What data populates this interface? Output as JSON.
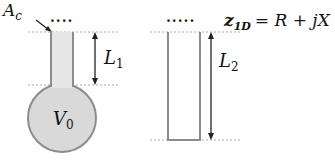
{
  "diagram": {
    "left_figure": {
      "name": "helmholtz-resonator",
      "labels": {
        "area_main": "A",
        "area_sub": "c",
        "length_main": "L",
        "length_sub": "1",
        "volume_main": "V",
        "volume_sub": "0"
      },
      "dots": "....",
      "colors": {
        "fill": "#d9d9d9",
        "stroke": "#8c8c8c"
      }
    },
    "right_figure": {
      "name": "closed-tube",
      "labels": {
        "length_main": "L",
        "length_sub": "2"
      },
      "dots": ".....",
      "colors": {
        "fill": "#ffffff",
        "stroke": "#8c8c8c"
      }
    },
    "equation": {
      "lhs_main": "z",
      "lhs_sub": "1D",
      "rhs": "= R + jX"
    },
    "guide_color": "#aaaaaa"
  }
}
